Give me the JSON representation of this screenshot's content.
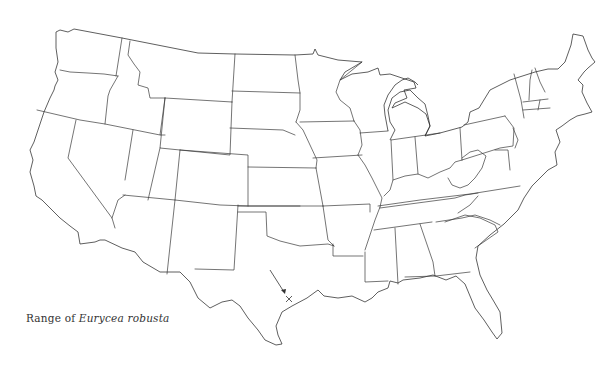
{
  "figure": {
    "caption": {
      "prefix": "Range of",
      "species": "Eurycea robusta"
    },
    "map_region": "Contiguous United States (state outlines)",
    "locality_marker": {
      "symbol": "×",
      "icon": "x-mark-icon",
      "pointer": "arrow-icon",
      "approx_location": "Central Texas"
    },
    "colors": {
      "background": "#ffffff",
      "outline": "#3a3a3a",
      "text": "#333333"
    }
  }
}
